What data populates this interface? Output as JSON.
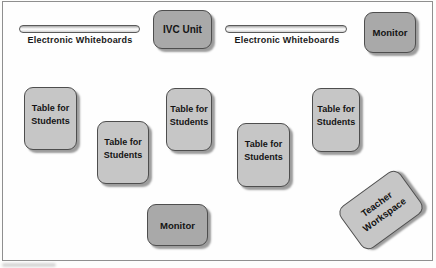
{
  "diagram": {
    "type": "classroom-layout",
    "colors": {
      "table_fill": "#c6c6c6",
      "equipment_fill": "#a9a9a9",
      "box_border": "#4e4e4e",
      "box_shadow": "#9c9c9c",
      "frame_border": "#8f8f8f",
      "text": "#141414",
      "background": "#fdfdfc"
    },
    "nodes": {
      "whiteboard_left": {
        "label": "Electronic Whiteboards"
      },
      "ivc_unit": {
        "label": "IVC Unit"
      },
      "whiteboard_right": {
        "label": "Electronic Whiteboards"
      },
      "monitor_top": {
        "label": "Monitor"
      },
      "monitor_bottom": {
        "label": "Monitor"
      },
      "table": {
        "line1": "Table for",
        "line2": "Students",
        "count": 5
      },
      "teacher_workspace": {
        "line1": "Teacher",
        "line2": "Workspace"
      }
    }
  }
}
